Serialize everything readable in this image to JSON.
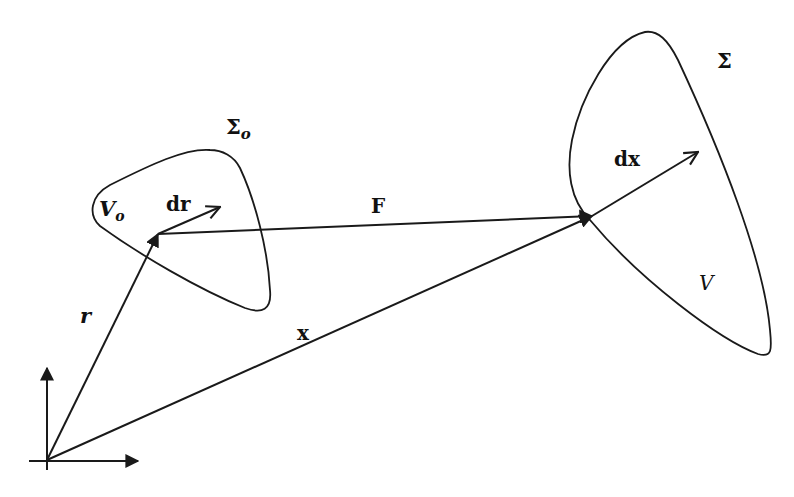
{
  "diagram": {
    "type": "continuum-deformation-map",
    "reference_configuration": {
      "boundary_label": "Σ",
      "boundary_subscript": "o",
      "volume_label": "V",
      "volume_subscript": "o"
    },
    "current_configuration": {
      "boundary_label": "Σ",
      "volume_label": "V"
    },
    "vectors": {
      "position_reference": "r",
      "position_current": "x",
      "differential_reference": "dr",
      "differential_current": "dx",
      "mapping": "F"
    },
    "colors": {
      "ink": "#1a1a1a",
      "background": "#ffffff"
    }
  }
}
